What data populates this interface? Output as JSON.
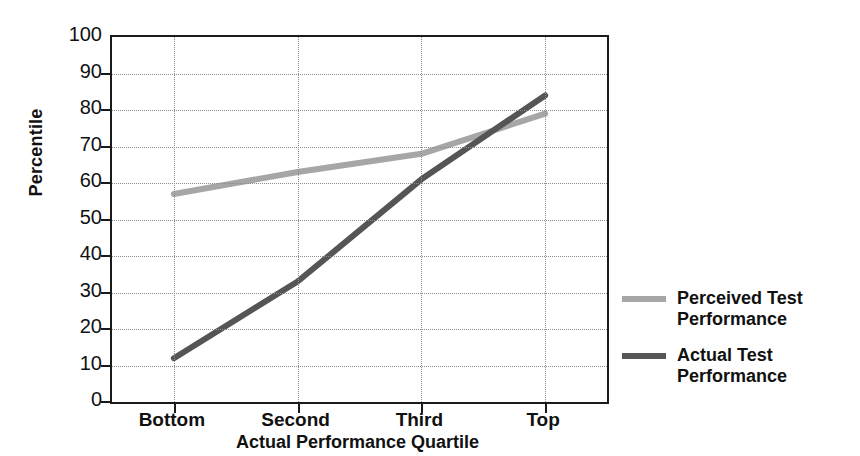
{
  "chart_data": {
    "type": "line",
    "title": "",
    "xlabel": "Actual Performance Quartile",
    "ylabel": "Percentile",
    "categories": [
      "Bottom",
      "Second",
      "Third",
      "Top"
    ],
    "ylim": [
      0,
      100
    ],
    "yticks": [
      100,
      90,
      80,
      70,
      60,
      50,
      40,
      30,
      20,
      10,
      0
    ],
    "grid": true,
    "legend_position": "right",
    "series": [
      {
        "name": "Perceived Test Performance",
        "color": "#a6a6a6",
        "values": [
          57,
          63,
          68,
          79
        ]
      },
      {
        "name": "Actual Test Performance",
        "color": "#555555",
        "values": [
          12,
          33,
          61,
          84
        ]
      }
    ]
  },
  "legend": {
    "items": [
      {
        "label_line1": "Perceived Test",
        "label_line2": "Performance"
      },
      {
        "label_line1": "Actual Test",
        "label_line2": "Performance"
      }
    ]
  }
}
